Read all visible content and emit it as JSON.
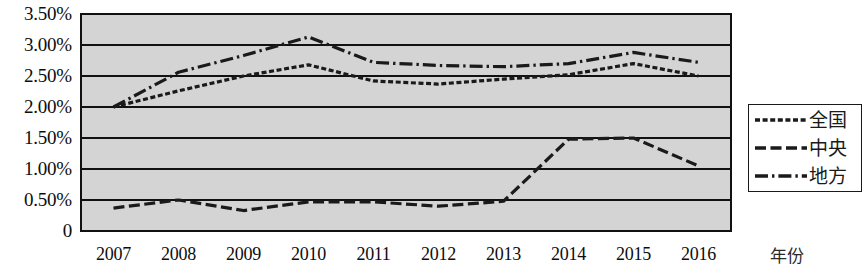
{
  "chart_data": {
    "type": "line",
    "title": "",
    "subtitle": "",
    "xlabel": "年份",
    "ylabel": "",
    "categories": [
      "2007",
      "2008",
      "2009",
      "2010",
      "2011",
      "2012",
      "2013",
      "2014",
      "2015",
      "2016"
    ],
    "x": [
      2007,
      2008,
      2009,
      2010,
      2011,
      2012,
      2013,
      2014,
      2015,
      2016
    ],
    "ylim": [
      0,
      3.5
    ],
    "ytick_labels": [
      "0",
      "0.50%",
      "1.00%",
      "1.50%",
      "2.00%",
      "2.50%",
      "3.00%",
      "3.50%"
    ],
    "ytick_values": [
      0,
      0.5,
      1.0,
      1.5,
      2.0,
      2.5,
      3.0,
      3.5
    ],
    "grid": true,
    "grid_axis": "y",
    "legend_position": "right",
    "plot_background": "#d4d4d4",
    "line_color": "#1a1a1a",
    "series": [
      {
        "name": "全国",
        "style": "dotted",
        "values": [
          2.0,
          2.26,
          2.5,
          2.68,
          2.42,
          2.37,
          2.45,
          2.52,
          2.7,
          2.5
        ]
      },
      {
        "name": "中央",
        "style": "dashed",
        "values": [
          0.37,
          0.5,
          0.33,
          0.47,
          0.47,
          0.4,
          0.48,
          1.48,
          1.5,
          1.05
        ]
      },
      {
        "name": "地方",
        "style": "dashdot",
        "values": [
          2.0,
          2.56,
          2.83,
          3.13,
          2.72,
          2.67,
          2.65,
          2.7,
          2.88,
          2.72
        ]
      }
    ]
  },
  "legend": {
    "entries": [
      {
        "label": "全国",
        "swatch": "dotted-line-icon"
      },
      {
        "label": "中央",
        "swatch": "dashed-line-icon"
      },
      {
        "label": "地方",
        "swatch": "dashdot-line-icon"
      }
    ]
  }
}
